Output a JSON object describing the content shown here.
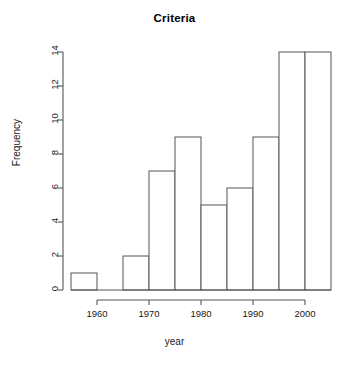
{
  "chart_data": {
    "type": "bar",
    "title": "Criteria",
    "xlabel": "year",
    "ylabel": "Frequency",
    "bin_width": 5,
    "bin_edges": [
      1955,
      1960,
      1965,
      1970,
      1975,
      1980,
      1985,
      1990,
      1995,
      2000,
      2005
    ],
    "categories": [
      "1955-1960",
      "1960-1965",
      "1965-1970",
      "1970-1975",
      "1975-1980",
      "1980-1985",
      "1985-1990",
      "1990-1995",
      "1995-2000",
      "2000-2005"
    ],
    "values": [
      1,
      0,
      2,
      7,
      9,
      5,
      6,
      9,
      14,
      14
    ],
    "xlim": [
      1955,
      2005
    ],
    "ylim": [
      0,
      14
    ],
    "xticks": [
      1960,
      1970,
      1980,
      1990,
      2000
    ],
    "xtick_labels": [
      "1960",
      "1970",
      "1980",
      "1990",
      "2000"
    ],
    "yticks": [
      0,
      2,
      4,
      6,
      8,
      10,
      12,
      14
    ],
    "ytick_labels": [
      "0",
      "2",
      "4",
      "6",
      "8",
      "10",
      "12",
      "14"
    ],
    "grid": false,
    "legend": false,
    "bar_fill": "#ffffff",
    "bar_stroke": "#555555",
    "axis_color": "#555555",
    "text_color": "#1a1a1a"
  }
}
